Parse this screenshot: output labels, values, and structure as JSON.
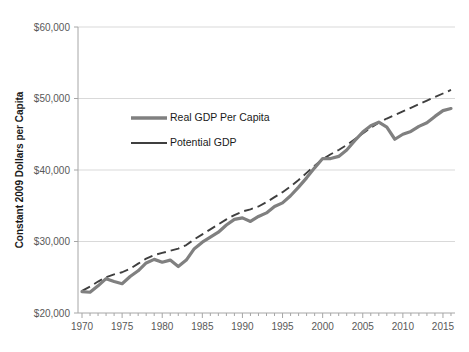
{
  "chart_data": {
    "type": "line",
    "title": "",
    "xlabel": "",
    "ylabel": "Constant 2009 Dollars per Capita",
    "xlim": [
      1969.5,
      2016.5
    ],
    "ylim": [
      20000,
      60000
    ],
    "y_ticks": [
      20000,
      30000,
      40000,
      50000,
      60000
    ],
    "y_tick_labels": [
      "$20,000",
      "$30,000",
      "$40,000",
      "$50,000",
      "$60,000"
    ],
    "x_ticks": [
      1970,
      1975,
      1980,
      1985,
      1990,
      1995,
      2000,
      2005,
      2010,
      2015
    ],
    "x_tick_labels": [
      "1970",
      "1975",
      "1980",
      "1985",
      "1990",
      "1995",
      "2000",
      "2005",
      "2010",
      "2015"
    ],
    "x_minor_tick_interval": 1,
    "grid": "horizontal",
    "legend_position": "upper-left-inside",
    "legend": [
      {
        "name": "Real GDP Per Capita",
        "color": "#808080",
        "width": 3.2,
        "dash": "none"
      },
      {
        "name": "Potential GDP",
        "color": "#3f3f3f",
        "width": 1.8,
        "dash": "long"
      }
    ],
    "series": [
      {
        "name": "Real GDP Per Capita",
        "color": "#808080",
        "x": [
          1970,
          1971,
          1972,
          1973,
          1974,
          1975,
          1976,
          1977,
          1978,
          1979,
          1980,
          1981,
          1982,
          1983,
          1984,
          1985,
          1986,
          1987,
          1988,
          1989,
          1990,
          1991,
          1992,
          1993,
          1994,
          1995,
          1996,
          1997,
          1998,
          1999,
          2000,
          2001,
          2002,
          2003,
          2004,
          2005,
          2006,
          2007,
          2008,
          2009,
          2010,
          2011,
          2012,
          2013,
          2014,
          2015,
          2016
        ],
        "values": [
          23000,
          22900,
          23800,
          24800,
          24400,
          24100,
          25100,
          25900,
          27000,
          27500,
          27100,
          27400,
          26500,
          27400,
          29000,
          29900,
          30600,
          31300,
          32300,
          33100,
          33300,
          32800,
          33500,
          34000,
          34900,
          35400,
          36400,
          37600,
          38900,
          40300,
          41600,
          41600,
          41900,
          42800,
          44100,
          45300,
          46200,
          46700,
          46000,
          44300,
          45000,
          45400,
          46100,
          46600,
          47500,
          48300,
          48600
        ],
        "values_note": "values in constant 2009 dollars per capita, read from chart"
      },
      {
        "name": "Potential GDP",
        "color": "#3f3f3f",
        "x": [
          1970,
          1971,
          1972,
          1973,
          1974,
          1975,
          1976,
          1977,
          1978,
          1979,
          1980,
          1981,
          1982,
          1983,
          1984,
          1985,
          1986,
          1987,
          1988,
          1989,
          1990,
          1991,
          1992,
          1993,
          1994,
          1995,
          1996,
          1997,
          1998,
          1999,
          2000,
          2001,
          2002,
          2003,
          2004,
          2005,
          2006,
          2007,
          2008,
          2009,
          2010,
          2011,
          2012,
          2013,
          2014,
          2015,
          2016
        ],
        "values": [
          23100,
          23700,
          24400,
          25000,
          25400,
          25700,
          26200,
          26900,
          27600,
          28100,
          28400,
          28700,
          29000,
          29500,
          30300,
          31000,
          31700,
          32400,
          33100,
          33700,
          34200,
          34500,
          34900,
          35500,
          36200,
          36900,
          37700,
          38600,
          39600,
          40600,
          41500,
          42200,
          42800,
          43500,
          44300,
          45100,
          45900,
          46600,
          47200,
          47700,
          48200,
          48700,
          49200,
          49700,
          50200,
          50700,
          51200
        ],
        "values_note": "potential output trend, dashed dark line"
      }
    ]
  },
  "axis": {
    "y_title": "Constant 2009 Dollars per Capita"
  },
  "colors": {
    "real_gdp": "#808080",
    "potential_gdp": "#3f3f3f",
    "gridline": "#d9d9d9",
    "axis": "#a6a6a6",
    "tick_text": "#595959",
    "title_text": "#1a1a1a",
    "background": "#ffffff"
  }
}
